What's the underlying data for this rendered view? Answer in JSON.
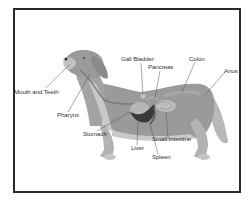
{
  "diagram": {
    "colors": {
      "border": "#2a2a2a",
      "body": "#9a9a9a",
      "body_light": "#c9c9c9",
      "organ_dark": "#3a3a3a",
      "organ_mid": "#b5b5b5",
      "leader_line": "#555555",
      "text": "#333333"
    },
    "labels": [
      {
        "id": "gall-bladder",
        "text": "Gall Bladder"
      },
      {
        "id": "pancreas",
        "text": "Pancreas"
      },
      {
        "id": "colon",
        "text": "Colon"
      },
      {
        "id": "anus",
        "text": "Anus"
      },
      {
        "id": "mouth-and-teeth",
        "text": "Mouth and Teeth"
      },
      {
        "id": "pharynx",
        "text": "Pharynx"
      },
      {
        "id": "stomach",
        "text": "Stomach"
      },
      {
        "id": "liver",
        "text": "Liver"
      },
      {
        "id": "small-intestine",
        "text": "Small Intestine"
      },
      {
        "id": "spleen",
        "text": "Spleen"
      }
    ]
  }
}
